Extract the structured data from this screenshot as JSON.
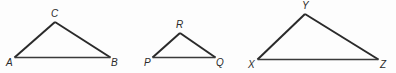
{
  "figure": {
    "background_color": "#fdfdfd",
    "stroke_color": "#2a2a2a",
    "triangles": [
      {
        "name": "triangle-abc",
        "labels": {
          "a": "A",
          "b": "B",
          "c": "C"
        }
      },
      {
        "name": "triangle-pqr",
        "labels": {
          "p": "P",
          "q": "Q",
          "r": "R"
        }
      },
      {
        "name": "triangle-xyz",
        "labels": {
          "x": "X",
          "y": "Y",
          "z": "Z"
        }
      }
    ]
  }
}
